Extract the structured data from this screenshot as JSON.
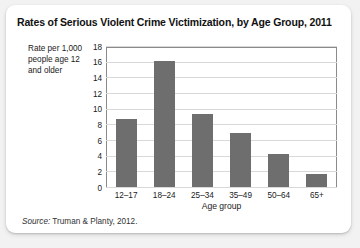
{
  "chart_data": {
    "type": "bar",
    "title": "Rates of Serious Violent Crime Victimization, by Age Group, 2011",
    "categories": [
      "12–17",
      "18–24",
      "25–34",
      "35–49",
      "50–64",
      "65+"
    ],
    "values": [
      8.8,
      16.3,
      9.5,
      7.0,
      4.3,
      1.7
    ],
    "xlabel": "Age group",
    "ylabel": "Rate per 1,000 people age 12 and older",
    "ylim": [
      0,
      18
    ],
    "yticks": [
      0,
      2,
      4,
      6,
      8,
      10,
      12,
      14,
      16,
      18
    ],
    "grid": true,
    "legend": false,
    "bar_color": "#6e6e6e"
  },
  "ylabel_lines": [
    "Rate per 1,000",
    "people age 12",
    "and older"
  ],
  "source": {
    "keyword": "Source:",
    "text": " Truman & Planty, 2012."
  }
}
